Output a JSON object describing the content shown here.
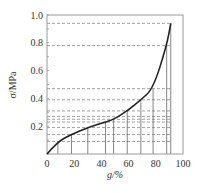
{
  "chart_data": {
    "type": "line",
    "title": "",
    "xlabel": "g/%",
    "ylabel": "σ/MPa",
    "xlim": [
      0,
      100
    ],
    "ylim": [
      0,
      1.0
    ],
    "x_ticks": [
      "0",
      "20",
      "40",
      "60",
      "80",
      "100"
    ],
    "y_ticks": [
      "0.2",
      "0.4",
      "0.6",
      "0.8",
      "1.0"
    ],
    "x_origin_label": "0",
    "grid": false,
    "series": [
      {
        "name": "stress-strain curve",
        "x": [
          0,
          8,
          18,
          30,
          43,
          49,
          59,
          69,
          78,
          88,
          91
        ],
        "y": [
          0,
          0.09,
          0.14,
          0.19,
          0.23,
          0.25,
          0.31,
          0.39,
          0.47,
          0.78,
          0.94
        ]
      }
    ],
    "vertical_marker_lines_x": [
      8,
      18,
      30,
      43,
      49,
      59,
      69,
      78,
      88,
      91
    ],
    "horizontal_dashed_lines_y": [
      0.09,
      0.14,
      0.19,
      0.23,
      0.25,
      0.27,
      0.31,
      0.39,
      0.47,
      0.78,
      0.94
    ]
  }
}
